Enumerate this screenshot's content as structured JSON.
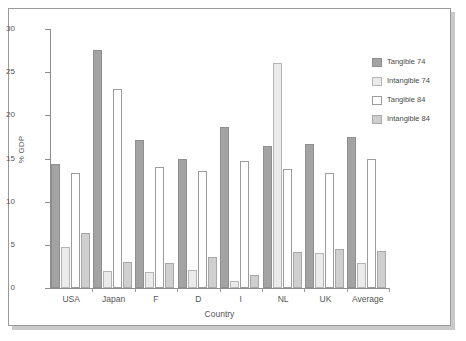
{
  "chart_data": {
    "type": "bar",
    "title": "",
    "xlabel": "Country",
    "ylabel": "% GDP",
    "ylim": [
      0,
      30
    ],
    "yticks": [
      0,
      5,
      10,
      15,
      20,
      25,
      30
    ],
    "grid": false,
    "legend_position": "right",
    "categories": [
      "USA",
      "Japan",
      "F",
      "D",
      "I",
      "NL",
      "UK",
      "Average"
    ],
    "series": [
      {
        "name": "Tangible 74",
        "color": "#a3a3a3",
        "values": [
          14.4,
          27.6,
          17.1,
          14.9,
          18.7,
          16.4,
          16.7,
          17.5
        ]
      },
      {
        "name": "Intangible 74",
        "color": "#ebebeb",
        "values": [
          4.8,
          2.0,
          1.9,
          2.1,
          0.8,
          26.1,
          4.0,
          2.9
        ]
      },
      {
        "name": "Tangible 84",
        "color": "#ffffff",
        "values": [
          13.3,
          23.0,
          14.0,
          13.6,
          14.7,
          13.8,
          13.3,
          14.9
        ]
      },
      {
        "name": "Intangible 84",
        "color": "#cfcfcf",
        "values": [
          6.4,
          3.0,
          2.9,
          3.6,
          1.5,
          4.2,
          4.5,
          4.3
        ]
      }
    ]
  }
}
